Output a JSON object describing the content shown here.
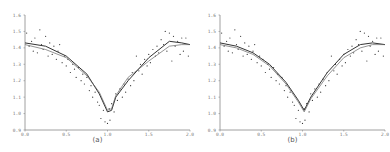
{
  "chart_data": [
    {
      "type": "scatter",
      "title": "",
      "caption": "(a)",
      "xlabel": "",
      "ylabel": "",
      "xlim": [
        0.0,
        2.0
      ],
      "ylim": [
        0.9,
        1.6
      ],
      "xticks": [
        "0.0",
        "0.5",
        "1.0",
        "1.5",
        "2.0"
      ],
      "yticks": [
        "0.9",
        "1.0",
        "1.1",
        "1.2",
        "1.3",
        "1.4",
        "1.5",
        "1.6"
      ],
      "grid": false,
      "legend": null,
      "series": [
        {
          "name": "observations",
          "kind": "scatter",
          "x": [
            0.02,
            0.05,
            0.08,
            0.1,
            0.12,
            0.15,
            0.18,
            0.2,
            0.22,
            0.25,
            0.28,
            0.3,
            0.33,
            0.35,
            0.38,
            0.4,
            0.42,
            0.45,
            0.48,
            0.5,
            0.52,
            0.55,
            0.58,
            0.6,
            0.62,
            0.65,
            0.68,
            0.7,
            0.72,
            0.75,
            0.78,
            0.8,
            0.82,
            0.85,
            0.88,
            0.9,
            0.92,
            0.95,
            0.97,
            1.0,
            1.02,
            1.03,
            1.05,
            1.08,
            1.1,
            1.12,
            1.15,
            1.18,
            1.2,
            1.22,
            1.25,
            1.28,
            1.3,
            1.32,
            1.35,
            1.38,
            1.4,
            1.42,
            1.45,
            1.48,
            1.5,
            1.52,
            1.55,
            1.58,
            1.6,
            1.62,
            1.65,
            1.68,
            1.7,
            1.72,
            1.75,
            1.78,
            1.8,
            1.82,
            1.85,
            1.88,
            1.9,
            1.92,
            1.95,
            1.98
          ],
          "y": [
            1.49,
            1.41,
            1.44,
            1.38,
            1.46,
            1.37,
            1.51,
            1.42,
            1.39,
            1.47,
            1.35,
            1.43,
            1.36,
            1.41,
            1.33,
            1.38,
            1.42,
            1.31,
            1.35,
            1.29,
            1.33,
            1.25,
            1.3,
            1.27,
            1.22,
            1.28,
            1.2,
            1.24,
            1.18,
            1.22,
            1.14,
            1.17,
            1.1,
            1.13,
            1.07,
            1.05,
            0.97,
            1.02,
            0.95,
            0.94,
            1.03,
            0.96,
            1.06,
            1.01,
            1.12,
            1.08,
            1.15,
            1.1,
            1.18,
            1.13,
            1.21,
            1.17,
            1.25,
            1.2,
            1.35,
            1.26,
            1.3,
            1.24,
            1.33,
            1.29,
            1.36,
            1.31,
            1.39,
            1.35,
            1.41,
            1.37,
            1.45,
            1.42,
            1.5,
            1.38,
            1.49,
            1.32,
            1.47,
            1.41,
            1.44,
            1.36,
            1.46,
            1.38,
            1.46,
            1.35
          ]
        },
        {
          "name": "fit-1",
          "kind": "line",
          "x": [
            0.0,
            0.25,
            0.5,
            0.75,
            0.9,
            1.0,
            1.05,
            1.1,
            1.25,
            1.5,
            1.75,
            1.9,
            2.0
          ],
          "y": [
            1.43,
            1.41,
            1.35,
            1.24,
            1.12,
            1.01,
            1.02,
            1.1,
            1.2,
            1.34,
            1.44,
            1.43,
            1.42
          ]
        },
        {
          "name": "fit-2",
          "kind": "line",
          "x": [
            0.0,
            0.25,
            0.5,
            0.75,
            0.9,
            1.0,
            1.05,
            1.1,
            1.25,
            1.5,
            1.75,
            1.9,
            2.0
          ],
          "y": [
            1.42,
            1.39,
            1.34,
            1.23,
            1.13,
            1.02,
            1.03,
            1.11,
            1.22,
            1.32,
            1.41,
            1.42,
            1.42
          ]
        }
      ]
    },
    {
      "type": "scatter",
      "title": "",
      "caption": "(b)",
      "xlabel": "",
      "ylabel": "",
      "xlim": [
        0.0,
        2.0
      ],
      "ylim": [
        0.9,
        1.6
      ],
      "xticks": [
        "0.0",
        "0.5",
        "1.0",
        "1.5",
        "2.0"
      ],
      "yticks": [
        "0.9",
        "1.0",
        "1.1",
        "1.2",
        "1.3",
        "1.4",
        "1.5",
        "1.6"
      ],
      "grid": false,
      "legend": null,
      "series": [
        {
          "name": "observations",
          "kind": "scatter",
          "x": [
            0.02,
            0.05,
            0.08,
            0.1,
            0.12,
            0.15,
            0.18,
            0.2,
            0.22,
            0.25,
            0.28,
            0.3,
            0.33,
            0.35,
            0.38,
            0.4,
            0.42,
            0.45,
            0.48,
            0.5,
            0.52,
            0.55,
            0.58,
            0.6,
            0.62,
            0.65,
            0.68,
            0.7,
            0.72,
            0.75,
            0.78,
            0.8,
            0.82,
            0.85,
            0.88,
            0.9,
            0.92,
            0.95,
            0.97,
            1.0,
            1.02,
            1.03,
            1.05,
            1.08,
            1.1,
            1.12,
            1.15,
            1.18,
            1.2,
            1.22,
            1.25,
            1.28,
            1.3,
            1.32,
            1.35,
            1.38,
            1.4,
            1.42,
            1.45,
            1.48,
            1.5,
            1.52,
            1.55,
            1.58,
            1.6,
            1.62,
            1.65,
            1.68,
            1.7,
            1.72,
            1.75,
            1.78,
            1.8,
            1.82,
            1.85,
            1.88,
            1.9,
            1.92,
            1.95,
            1.98
          ],
          "y": [
            1.49,
            1.41,
            1.44,
            1.38,
            1.46,
            1.37,
            1.51,
            1.42,
            1.39,
            1.47,
            1.35,
            1.43,
            1.36,
            1.41,
            1.33,
            1.38,
            1.42,
            1.31,
            1.35,
            1.29,
            1.33,
            1.25,
            1.3,
            1.27,
            1.22,
            1.28,
            1.2,
            1.24,
            1.18,
            1.22,
            1.14,
            1.17,
            1.1,
            1.13,
            1.07,
            1.05,
            0.97,
            1.02,
            0.95,
            0.94,
            1.03,
            0.96,
            1.06,
            1.01,
            1.12,
            1.08,
            1.15,
            1.1,
            1.18,
            1.13,
            1.21,
            1.17,
            1.25,
            1.2,
            1.35,
            1.26,
            1.3,
            1.24,
            1.33,
            1.29,
            1.36,
            1.31,
            1.39,
            1.35,
            1.41,
            1.37,
            1.45,
            1.42,
            1.5,
            1.38,
            1.49,
            1.32,
            1.47,
            1.41,
            1.44,
            1.36,
            1.46,
            1.38,
            1.46,
            1.35
          ]
        },
        {
          "name": "fit-1",
          "kind": "line",
          "x": [
            0.0,
            0.2,
            0.4,
            0.6,
            0.8,
            0.95,
            1.02,
            1.1,
            1.3,
            1.5,
            1.7,
            1.85,
            2.0
          ],
          "y": [
            1.43,
            1.41,
            1.37,
            1.3,
            1.19,
            1.08,
            1.02,
            1.1,
            1.25,
            1.36,
            1.42,
            1.43,
            1.42
          ]
        },
        {
          "name": "fit-2",
          "kind": "line",
          "x": [
            0.0,
            0.2,
            0.4,
            0.6,
            0.8,
            0.95,
            1.02,
            1.1,
            1.3,
            1.5,
            1.7,
            1.85,
            2.0
          ],
          "y": [
            1.42,
            1.4,
            1.36,
            1.29,
            1.18,
            1.07,
            1.01,
            1.09,
            1.23,
            1.34,
            1.4,
            1.42,
            1.42
          ]
        }
      ]
    }
  ],
  "panels": [
    {
      "caption": "(a)"
    },
    {
      "caption": "(b)"
    }
  ]
}
